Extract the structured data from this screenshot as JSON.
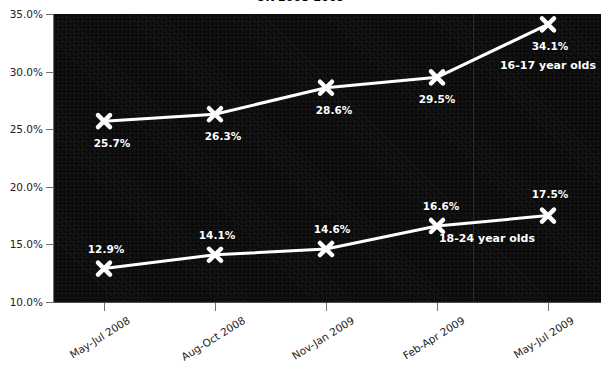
{
  "chart_data": {
    "type": "line",
    "title": "UK 2008-2009",
    "xlabel": "",
    "ylabel": "",
    "categories": [
      "May-Jul 2008",
      "Aug-Oct 2008",
      "Nov-Jan 2009",
      "Feb-Apr 2009",
      "May-Jul 2009"
    ],
    "ylim": [
      10.0,
      35.0
    ],
    "ytick_labels": [
      "10.0%",
      "15.0%",
      "20.0%",
      "25.0%",
      "30.0%",
      "35.0%"
    ],
    "ytick_values": [
      10.0,
      15.0,
      20.0,
      25.0,
      30.0,
      35.0
    ],
    "grid": false,
    "legend_position": "inline-annotation",
    "series": [
      {
        "name": "16-17 year olds",
        "values": [
          25.7,
          26.3,
          28.6,
          29.5,
          34.1
        ],
        "value_labels": [
          "25.7%",
          "26.3%",
          "28.6%",
          "29.5%",
          "34.1%"
        ],
        "color": "#ffffff",
        "marker": "x"
      },
      {
        "name": "18-24 year olds",
        "values": [
          12.9,
          14.1,
          14.6,
          16.6,
          17.5
        ],
        "value_labels": [
          "12.9%",
          "14.1%",
          "14.6%",
          "16.6%",
          "17.5%"
        ],
        "color": "#ffffff",
        "marker": "x"
      }
    ],
    "annotations": [
      {
        "text": "16-17 year olds",
        "x_px": 548,
        "y_px": 65
      },
      {
        "text": "18-24 year olds",
        "x_px": 487,
        "y_px": 238
      }
    ],
    "colors": {
      "plot_background": "#0a0a0a",
      "line": "#ffffff",
      "axis": "#6f6f6f",
      "text": "#222222",
      "label_text": "#ffffff"
    }
  }
}
